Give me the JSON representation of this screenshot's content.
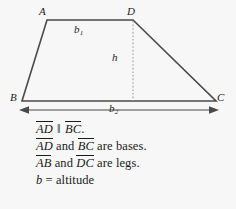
{
  "figure": {
    "type": "trapezoid-geometry-diagram",
    "vertices": [
      {
        "id": "A",
        "label": "A",
        "x": 43,
        "y": 13
      },
      {
        "id": "D",
        "label": "D",
        "x": 130,
        "y": 13
      },
      {
        "id": "B",
        "label": "B",
        "x": 14,
        "y": 97
      },
      {
        "id": "C",
        "label": "C",
        "x": 219,
        "y": 97
      }
    ],
    "measure_labels": {
      "top_base": {
        "base": "b",
        "subscript": "1",
        "x": 76,
        "y": 27
      },
      "bottom_base": {
        "base": "b",
        "subscript": "2",
        "x": 111,
        "y": 106
      },
      "altitude": {
        "base": "h",
        "subscript": "",
        "x": 113,
        "y": 58
      }
    },
    "colors": {
      "background": "#f7f7f7",
      "stroke": "#4a4a4a",
      "text": "#1a1a1a",
      "dashed": "#9a9a9a"
    }
  },
  "caption": {
    "lines": [
      {
        "id": "parallel-statement",
        "parts": [
          {
            "kind": "segment",
            "text": "AD"
          },
          {
            "kind": "plain",
            "text": " "
          },
          {
            "kind": "parallel",
            "text": "‖"
          },
          {
            "kind": "plain",
            "text": " "
          },
          {
            "kind": "segment",
            "text": "BC"
          },
          {
            "kind": "plain",
            "text": "."
          }
        ]
      },
      {
        "id": "bases-statement",
        "parts": [
          {
            "kind": "segment",
            "text": "AD"
          },
          {
            "kind": "plain",
            "text": " and "
          },
          {
            "kind": "segment",
            "text": "BC"
          },
          {
            "kind": "plain",
            "text": " are bases."
          }
        ]
      },
      {
        "id": "legs-statement",
        "parts": [
          {
            "kind": "segment",
            "text": "AB"
          },
          {
            "kind": "plain",
            "text": " and "
          },
          {
            "kind": "segment",
            "text": "DC"
          },
          {
            "kind": "plain",
            "text": " are legs."
          }
        ]
      },
      {
        "id": "altitude-statement",
        "parts": [
          {
            "kind": "var",
            "text": "b"
          },
          {
            "kind": "plain",
            "text": " = altitude"
          }
        ]
      }
    ]
  }
}
